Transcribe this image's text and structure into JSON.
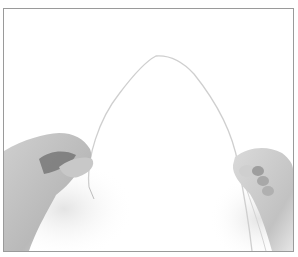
{
  "image": {
    "alt": "Two hands holding a thin flexible wire bent into an arch against a white background",
    "style": "grayscale photograph",
    "colors": {
      "background": "#ffffff",
      "frame": "#9a9a9a",
      "skin_light": "#d6d6d6",
      "skin_mid": "#b4b4b4",
      "skin_dark": "#6e6e6e",
      "wire": "#cfcfcf"
    },
    "subjects": [
      "left-hand",
      "right-hand",
      "arched-wire"
    ]
  }
}
